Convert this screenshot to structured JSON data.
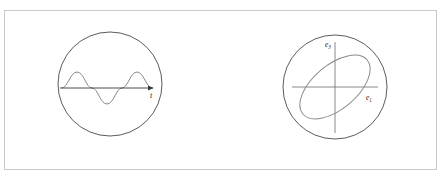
{
  "figure": {
    "background_color": "#ffffff",
    "frame": {
      "stroke_color": "#c9c9c9",
      "x": 4,
      "y": 10,
      "width": 433,
      "height": 160
    },
    "panels": [
      {
        "id": "time-series-panel",
        "name": "sine-wave-panel",
        "circle": {
          "cx": 110,
          "cy": 84,
          "r": 52,
          "stroke_color": "#4a4a4a"
        },
        "axis": {
          "name": "time-axis",
          "label": "t",
          "label_x": 150,
          "label_y": 96,
          "x1": 60,
          "x2": 156,
          "y": 88,
          "stroke_color": "#3a3a3a",
          "has_arrowhead": true
        },
        "wave": {
          "name": "sine-curve",
          "stroke_color": "#7a7a7a",
          "amplitude": 16,
          "periods": 2,
          "x_start": 62,
          "x_end": 152,
          "baseline_y": 88
        }
      },
      {
        "id": "polarization-ellipse-panel",
        "name": "ellipse-panel",
        "circle": {
          "cx": 335,
          "cy": 87,
          "r": 52,
          "stroke_color": "#4a4a4a"
        },
        "axes": [
          {
            "name": "e1-axis",
            "orientation": "horizontal",
            "label": "e",
            "subscript": "1",
            "label_x": 368,
            "label_y": 99,
            "x1": 292,
            "x2": 378,
            "y1": 87,
            "y2": 87,
            "stroke_color": "#6a6a6a"
          },
          {
            "name": "e3-axis",
            "orientation": "vertical",
            "label": "e",
            "subscript": "3",
            "label_x": 327,
            "label_y": 45,
            "x1": 335,
            "x2": 335,
            "y1": 42,
            "y2": 133,
            "stroke_color": "#6a6a6a"
          }
        ],
        "ellipse": {
          "name": "polarization-ellipse",
          "cx": 335,
          "cy": 87,
          "rx": 42,
          "ry": 22,
          "rotation_deg": -40,
          "stroke_color": "#7a7a7a"
        }
      }
    ]
  }
}
